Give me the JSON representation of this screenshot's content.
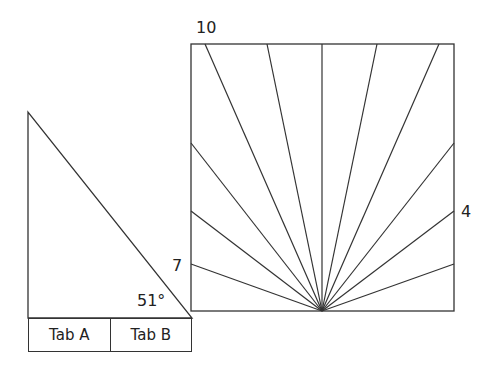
{
  "diagram": {
    "square": {
      "x": 191,
      "y": 44,
      "width": 263,
      "height": 267,
      "fan_origin": [
        322,
        311
      ]
    },
    "fan_endpoints": [
      [
        191,
        264
      ],
      [
        191,
        211
      ],
      [
        191,
        143
      ],
      [
        205,
        44
      ],
      [
        267,
        44
      ],
      [
        322,
        44
      ],
      [
        377,
        44
      ],
      [
        439,
        44
      ],
      [
        454,
        143
      ],
      [
        454,
        211
      ],
      [
        454,
        264
      ]
    ],
    "triangle": {
      "points": [
        [
          28,
          112
        ],
        [
          28,
          318
        ],
        [
          192,
          318
        ]
      ]
    },
    "line_color": "#333333"
  },
  "labels": {
    "top_left": "10",
    "right": "4",
    "left": "7",
    "angle": "51°"
  },
  "tabs": [
    {
      "label": "Tab A"
    },
    {
      "label": "Tab B"
    }
  ]
}
